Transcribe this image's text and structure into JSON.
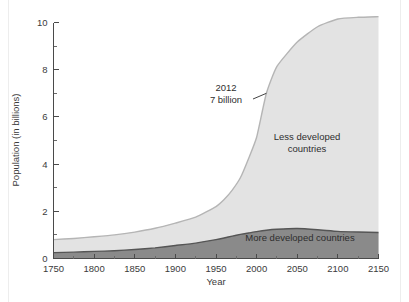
{
  "figure": {
    "name": "world-population-projection-chart",
    "background_color": "#ffffff"
  },
  "chart_data": {
    "type": "area",
    "stacked": true,
    "title": "",
    "subtitle": "",
    "xlabel": "Year",
    "ylabel": "Population (in billions)",
    "xlim": [
      1750,
      2150
    ],
    "ylim": [
      0,
      10
    ],
    "grid": false,
    "legend_position": "in-plot-labels",
    "x_ticks": [
      1750,
      1800,
      1850,
      1900,
      1950,
      2000,
      2050,
      2100,
      2150
    ],
    "x_tick_labels": [
      "1750",
      "1800",
      "1850",
      "1900",
      "1950",
      "2000",
      "2050",
      "2100",
      "2150"
    ],
    "x_minor_ticks": [
      1775,
      1825,
      1875,
      1925,
      1975,
      2025,
      2075,
      2125
    ],
    "y_ticks": [
      0,
      2,
      4,
      6,
      8,
      10
    ],
    "y_tick_labels": [
      "0",
      "2",
      "4",
      "6",
      "8",
      "10"
    ],
    "y_minor_ticks": [
      1,
      3,
      5,
      7,
      9
    ],
    "x": [
      1750,
      1775,
      1800,
      1825,
      1850,
      1875,
      1900,
      1925,
      1950,
      1960,
      1970,
      1980,
      1990,
      2000,
      2012,
      2025,
      2050,
      2075,
      2100,
      2125,
      2150
    ],
    "series": [
      {
        "name": "More developed countries",
        "color": "#8a8a8a",
        "edge_color": "#555555",
        "values": [
          0.25,
          0.27,
          0.3,
          0.33,
          0.38,
          0.45,
          0.55,
          0.65,
          0.8,
          0.87,
          0.95,
          1.02,
          1.08,
          1.14,
          1.2,
          1.24,
          1.27,
          1.22,
          1.15,
          1.12,
          1.1
        ]
      },
      {
        "name": "Less developed countries",
        "color": "#e3e3e3",
        "edge_color": "#b5b5b5",
        "values": [
          0.55,
          0.58,
          0.62,
          0.67,
          0.74,
          0.83,
          0.95,
          1.1,
          1.4,
          1.63,
          1.95,
          2.4,
          3.15,
          4.0,
          5.8,
          6.9,
          7.9,
          8.6,
          9.0,
          9.1,
          9.15
        ]
      }
    ],
    "totals": [
      0.8,
      0.85,
      0.92,
      1.0,
      1.12,
      1.28,
      1.5,
      1.75,
      2.2,
      2.5,
      2.9,
      3.42,
      4.23,
      5.14,
      7.0,
      8.14,
      9.17,
      9.82,
      10.15,
      10.22,
      10.25
    ],
    "annotations": [
      {
        "name": "2012-7-billion-callout",
        "line1": "2012",
        "line2": "7 billion",
        "points_to_x": 2012,
        "points_to_y": 7
      }
    ],
    "area_labels": [
      {
        "name": "less-developed-countries-label",
        "line1": "Less developed",
        "line2": "countries"
      },
      {
        "name": "more-developed-countries-label",
        "line1": "More developed countries",
        "line2": ""
      }
    ]
  }
}
